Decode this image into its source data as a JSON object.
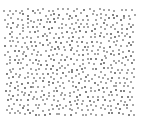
{
  "pattern": {
    "type": "stipple-dot-field",
    "background": "#ffffff",
    "dot_color": "#8a8a8a",
    "dot_color_dark": "#5a5a5a",
    "bounds": {
      "x0": 5,
      "y0": 9,
      "x1": 135,
      "y1": 117
    },
    "spacing": 5.2,
    "seed": 7
  }
}
